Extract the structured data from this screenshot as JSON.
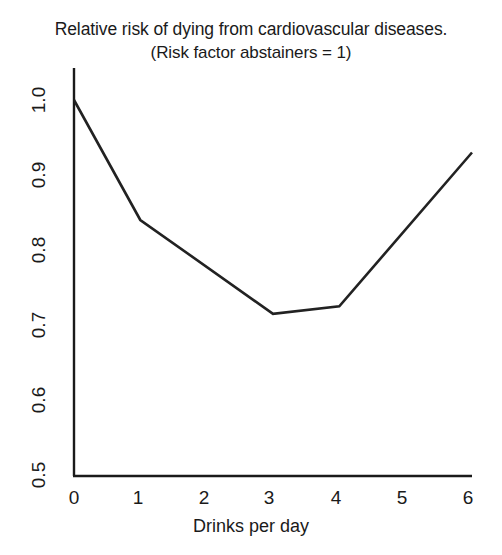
{
  "chart_data": {
    "type": "line",
    "title": "Relative risk of dying from cardiovascular diseases.",
    "subtitle": "(Risk factor abstainers = 1)",
    "xlabel": "Drinks per day",
    "ylabel": "",
    "x": [
      0,
      1,
      3,
      4,
      6
    ],
    "values": [
      1.0,
      0.84,
      0.715,
      0.725,
      0.93
    ],
    "series": [
      {
        "name": "Relative risk",
        "points": [
          {
            "x": 0,
            "y": 1.0
          },
          {
            "x": 1,
            "y": 0.84
          },
          {
            "x": 3,
            "y": 0.715
          },
          {
            "x": 4,
            "y": 0.725
          },
          {
            "x": 6,
            "y": 0.93
          }
        ]
      }
    ],
    "xlim": [
      0,
      6
    ],
    "ylim": [
      0.5,
      1.0
    ],
    "xticks": [
      "0",
      "1",
      "2",
      "3",
      "4",
      "5",
      "6"
    ],
    "yticks": [
      "0.5",
      "0.6",
      "0.7",
      "0.8",
      "0.9",
      "1.0"
    ],
    "grid": false,
    "legend": false,
    "line_color": "#222222",
    "axis_color": "#1a1a1a",
    "background": "#ffffff"
  },
  "title": {
    "line1": "Relative risk of dying from cardiovascular diseases.",
    "line2": "(Risk factor abstainers = 1)"
  },
  "axes": {
    "x_title": "Drinks per day",
    "x_ticks": [
      "0",
      "1",
      "2",
      "3",
      "4",
      "5",
      "6"
    ],
    "y_ticks": [
      "0.5",
      "0.6",
      "0.7",
      "0.8",
      "0.9",
      "1.0"
    ]
  }
}
